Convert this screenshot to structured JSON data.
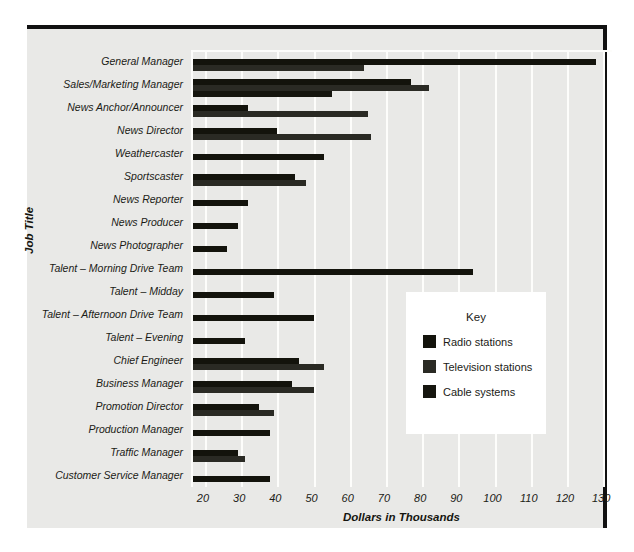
{
  "chart_data": {
    "type": "bar",
    "orientation": "horizontal",
    "title": "",
    "xlabel": "Dollars in Thousands",
    "ylabel": "Job Title",
    "xlim": [
      16.7,
      133
    ],
    "xticks": [
      20,
      30,
      40,
      50,
      60,
      70,
      80,
      90,
      100,
      110,
      120,
      130
    ],
    "grid": true,
    "legend_title": "Key",
    "legend_position": "center-right",
    "categories": [
      "General Manager",
      "Sales/Marketing Manager",
      "News Anchor/Announcer",
      "News Director",
      "Weathercaster",
      "Sportscaster",
      "News Reporter",
      "News Producer",
      "News Photographer",
      "Talent – Morning Drive Team",
      "Talent – Midday",
      "Talent – Afternoon Drive Team",
      "Talent – Evening",
      "Chief Engineer",
      "Business Manager",
      "Promotion Director",
      "Production Manager",
      "Traffic Manager",
      "Customer Service Manager"
    ],
    "series": [
      {
        "name": "Radio stations",
        "color": "#13130c",
        "values": [
          128,
          77,
          32,
          40,
          53,
          45,
          32,
          29,
          26,
          94,
          39,
          50,
          31,
          46,
          44,
          35,
          38,
          29,
          38
        ]
      },
      {
        "name": "Television stations",
        "color": "#2a2a24",
        "values": [
          64,
          82,
          65,
          66,
          null,
          48,
          null,
          null,
          null,
          null,
          null,
          null,
          null,
          53,
          50,
          39,
          null,
          31,
          null
        ]
      },
      {
        "name": "Cable systems",
        "color": "#16160f",
        "values": [
          null,
          55,
          null,
          null,
          null,
          null,
          null,
          null,
          null,
          null,
          null,
          null,
          null,
          null,
          null,
          null,
          null,
          null,
          null
        ]
      }
    ]
  },
  "legend": {
    "title": "Key",
    "items": [
      {
        "label": "Radio stations",
        "color": "#13130c"
      },
      {
        "label": "Television stations",
        "color": "#2a2a24"
      },
      {
        "label": "Cable systems",
        "color": "#16160f"
      }
    ]
  }
}
